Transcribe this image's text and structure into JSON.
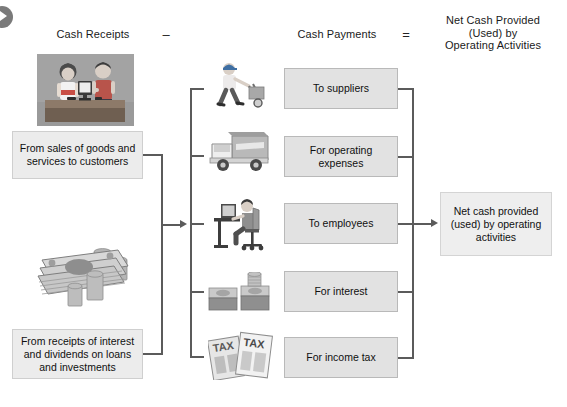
{
  "diagram": {
    "headers": {
      "receipts": "Cash Receipts",
      "minus_sign": "–",
      "payments": "Cash Payments",
      "equals_sign": "=",
      "result": "Net Cash Provided\n(Used) by\nOperating Activities",
      "result_line1": "Net Cash Provided",
      "result_line2": "(Used) by",
      "result_line3": "Operating Activities"
    },
    "receipts": [
      {
        "label": "From sales of goods and services to customers",
        "icon": "cashier-counter-illustration"
      },
      {
        "label": "From receipts of interest and dividends on loans and investments",
        "icon": "cash-and-coins-illustration"
      }
    ],
    "payments": [
      {
        "label": "To suppliers",
        "icon": "delivery-person-hand-truck-illustration"
      },
      {
        "label": "For operating expenses",
        "icon": "delivery-truck-illustration"
      },
      {
        "label": "To employees",
        "icon": "office-worker-desk-illustration"
      },
      {
        "label": "For interest",
        "icon": "stacked-money-illustration"
      },
      {
        "label": "For income tax",
        "icon": "tax-forms-illustration"
      }
    ],
    "result": {
      "label": "Net cash provided (used) by operating activities"
    },
    "colors": {
      "box_fill": "#e2e2e2",
      "box_border": "#b9b9b9",
      "light_box_fill": "#ececec",
      "result_fill": "#eeeeee",
      "connector": "#5b5b5b",
      "background": "#ffffff"
    }
  }
}
